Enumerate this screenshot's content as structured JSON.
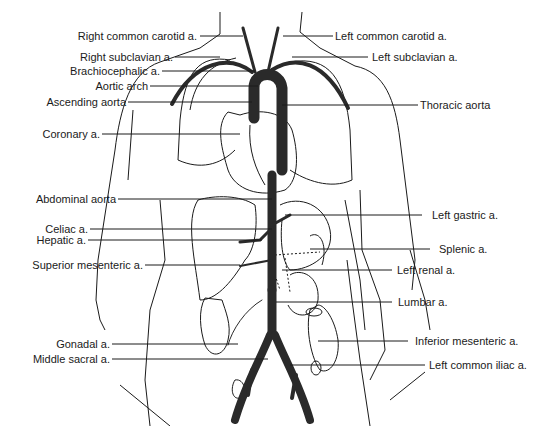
{
  "diagram": {
    "left_labels": [
      {
        "text": "Right common carotid a.",
        "y": 36
      },
      {
        "text": "Right subclavian a.",
        "y": 57
      },
      {
        "text": "Brachiocephalic a.",
        "y": 71
      },
      {
        "text": "Aortic arch",
        "y": 86
      },
      {
        "text": "Ascending aorta",
        "y": 102
      },
      {
        "text": "Coronary a.",
        "y": 134
      },
      {
        "text": "Abdominal aorta",
        "y": 199
      },
      {
        "text": "Celiac a.",
        "y": 229
      },
      {
        "text": "Hepatic a.",
        "y": 240
      },
      {
        "text": "Superior mesenteric a.",
        "y": 265
      },
      {
        "text": "Gonadal a.",
        "y": 344
      },
      {
        "text": "Middle sacral a.",
        "y": 359
      }
    ],
    "right_labels": [
      {
        "text": "Left common carotid a.",
        "y": 36
      },
      {
        "text": "Left subclavian a.",
        "y": 57
      },
      {
        "text": "Thoracic aorta",
        "y": 105
      },
      {
        "text": "Left gastric a.",
        "y": 215
      },
      {
        "text": "Splenic a.",
        "y": 249
      },
      {
        "text": "Left renal a.",
        "y": 270
      },
      {
        "text": "Lumbar a.",
        "y": 302
      },
      {
        "text": "Inferior mesenteric a.",
        "y": 341
      },
      {
        "text": "Left common iliac a.",
        "y": 365
      }
    ],
    "colors": {
      "artery": "#2a2a2a",
      "outline": "#1a1a1a",
      "background": "#ffffff"
    }
  }
}
